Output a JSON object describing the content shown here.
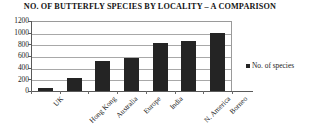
{
  "chart_data": {
    "type": "bar",
    "title": "NO. OF BUTTERFLY SPECIES BY LOCALITY – A COMPARISON",
    "xlabel": "",
    "ylabel": "",
    "categories": [
      "UK",
      "Hong Kong",
      "Australia",
      "Europe",
      "India",
      "N. America",
      "Borneo"
    ],
    "series": [
      {
        "name": "No. of species",
        "values": [
          60,
          220,
          520,
          560,
          830,
          850,
          1000
        ],
        "color": "#242424"
      }
    ],
    "ylim": [
      0,
      1200
    ],
    "ytick_values": [
      0,
      200,
      400,
      600,
      800,
      1000,
      1200
    ],
    "ytick_labels": [
      "0",
      "200",
      "400",
      "600",
      "800",
      "1000",
      "1200"
    ],
    "grid": true,
    "grid_axis": "y",
    "legend_position": "right",
    "legend_entries": [
      "No. of species"
    ]
  },
  "legend": {
    "marker_icon": "square-marker-icon",
    "label": "No. of species"
  },
  "colors": {
    "bar": "#242424",
    "grid": "#a8a8a8",
    "axis": "#5a5a5a",
    "text": "#1c1c1c",
    "background": "#ffffff"
  }
}
